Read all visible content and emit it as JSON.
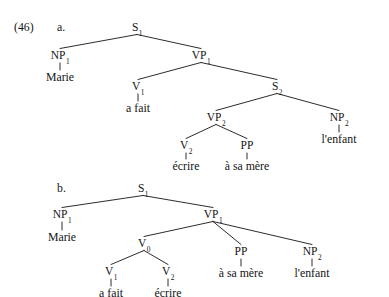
{
  "figure": {
    "example_number": "(46)",
    "background_color": "#ffffff",
    "ink_color": "#141414",
    "trees": [
      {
        "id": "tree-a",
        "label": "a.",
        "sentence": "Marie a fait écrire à sa mère l'enfant",
        "nodes": [
          {
            "id": "a-s1",
            "text": "S",
            "sub": "1",
            "x": 137,
            "y": 22,
            "kind": "nonterminal"
          },
          {
            "id": "a-np1",
            "text": "NP",
            "sub": "1",
            "x": 60,
            "y": 50,
            "kind": "nonterminal"
          },
          {
            "id": "a-vp1",
            "text": "VP",
            "sub": "1",
            "x": 201,
            "y": 50,
            "kind": "nonterminal"
          },
          {
            "id": "a-v1",
            "text": "V",
            "sub": "1",
            "x": 138,
            "y": 81,
            "kind": "nonterminal"
          },
          {
            "id": "a-s2",
            "text": "S",
            "sub": "2",
            "x": 277,
            "y": 81,
            "kind": "nonterminal"
          },
          {
            "id": "a-vp2",
            "text": "VP",
            "sub": "2",
            "x": 216,
            "y": 112,
            "kind": "nonterminal"
          },
          {
            "id": "a-np2",
            "text": "NP",
            "sub": "2",
            "x": 339,
            "y": 112,
            "kind": "nonterminal"
          },
          {
            "id": "a-v2",
            "text": "V",
            "sub": "2",
            "x": 186,
            "y": 140,
            "kind": "nonterminal"
          },
          {
            "id": "a-pp",
            "text": "PP",
            "sub": "",
            "x": 247,
            "y": 140,
            "kind": "nonterminal"
          }
        ],
        "leaves": [
          {
            "id": "a-marie",
            "text": "Marie",
            "x": 60,
            "y": 72,
            "parent": "a-np1"
          },
          {
            "id": "a-afait",
            "text": "a fait",
            "x": 138,
            "y": 103,
            "parent": "a-v1"
          },
          {
            "id": "a-ecrire",
            "text": "écrire",
            "x": 186,
            "y": 161,
            "parent": "a-v2"
          },
          {
            "id": "a-asamere",
            "text": "à sa mère",
            "x": 247,
            "y": 161,
            "parent": "a-pp"
          },
          {
            "id": "a-lenfant",
            "text": "l'enfant",
            "x": 339,
            "y": 134,
            "parent": "a-np2"
          }
        ],
        "branches": [
          {
            "from": "a-s1",
            "to": "a-np1"
          },
          {
            "from": "a-s1",
            "to": "a-vp1"
          },
          {
            "from": "a-vp1",
            "to": "a-v1"
          },
          {
            "from": "a-vp1",
            "to": "a-s2"
          },
          {
            "from": "a-s2",
            "to": "a-vp2"
          },
          {
            "from": "a-s2",
            "to": "a-np2"
          },
          {
            "from": "a-vp2",
            "to": "a-v2"
          },
          {
            "from": "a-vp2",
            "to": "a-pp"
          }
        ],
        "stems": [
          {
            "from": "a-np1",
            "to": "a-marie"
          },
          {
            "from": "a-v1",
            "to": "a-afait"
          },
          {
            "from": "a-v2",
            "to": "a-ecrire"
          },
          {
            "from": "a-pp",
            "to": "a-asamere"
          },
          {
            "from": "a-np2",
            "to": "a-lenfant"
          }
        ]
      },
      {
        "id": "tree-b",
        "label": "b.",
        "sentence": "Marie a fait écrire à sa mère l'enfant",
        "nodes": [
          {
            "id": "b-s1",
            "text": "S",
            "sub": "1",
            "x": 143,
            "y": 183,
            "kind": "nonterminal"
          },
          {
            "id": "b-np1",
            "text": "NP",
            "sub": "1",
            "x": 62,
            "y": 209,
            "kind": "nonterminal"
          },
          {
            "id": "b-vp1",
            "text": "VP",
            "sub": "1",
            "x": 213,
            "y": 209,
            "kind": "nonterminal"
          },
          {
            "id": "b-v0",
            "text": "V",
            "sub": "0",
            "x": 144,
            "y": 238,
            "kind": "nonterminal"
          },
          {
            "id": "b-pp",
            "text": "PP",
            "sub": "",
            "x": 241,
            "y": 246,
            "kind": "nonterminal"
          },
          {
            "id": "b-np2",
            "text": "NP",
            "sub": "2",
            "x": 312,
            "y": 246,
            "kind": "nonterminal"
          },
          {
            "id": "b-v1",
            "text": "V",
            "sub": "1",
            "x": 111,
            "y": 266,
            "kind": "nonterminal"
          },
          {
            "id": "b-v2",
            "text": "V",
            "sub": "2",
            "x": 168,
            "y": 266,
            "kind": "nonterminal"
          }
        ],
        "leaves": [
          {
            "id": "b-marie",
            "text": "Marie",
            "x": 62,
            "y": 232,
            "parent": "b-np1"
          },
          {
            "id": "b-asamere",
            "text": "à sa mère",
            "x": 241,
            "y": 268,
            "parent": "b-pp"
          },
          {
            "id": "b-lenfant",
            "text": "l'enfant",
            "x": 312,
            "y": 268,
            "parent": "b-np2"
          },
          {
            "id": "b-afait",
            "text": "a fait",
            "x": 111,
            "y": 288,
            "parent": "b-v1"
          },
          {
            "id": "b-ecrire",
            "text": "écrire",
            "x": 168,
            "y": 288,
            "parent": "b-v2"
          }
        ],
        "branches": [
          {
            "from": "b-s1",
            "to": "b-np1"
          },
          {
            "from": "b-s1",
            "to": "b-vp1"
          },
          {
            "from": "b-vp1",
            "to": "b-v0"
          },
          {
            "from": "b-vp1",
            "to": "b-pp"
          },
          {
            "from": "b-vp1",
            "to": "b-np2"
          },
          {
            "from": "b-v0",
            "to": "b-v1"
          },
          {
            "from": "b-v0",
            "to": "b-v2"
          }
        ],
        "stems": [
          {
            "from": "b-np1",
            "to": "b-marie"
          },
          {
            "from": "b-pp",
            "to": "b-asamere"
          },
          {
            "from": "b-np2",
            "to": "b-lenfant"
          },
          {
            "from": "b-v1",
            "to": "b-afait"
          },
          {
            "from": "b-v2",
            "to": "b-ecrire"
          }
        ]
      }
    ],
    "label_positions": {
      "example_number": {
        "x": 14,
        "y": 22
      },
      "tree_a_label": {
        "x": 57,
        "y": 22
      },
      "tree_b_label": {
        "x": 57,
        "y": 183
      }
    }
  }
}
